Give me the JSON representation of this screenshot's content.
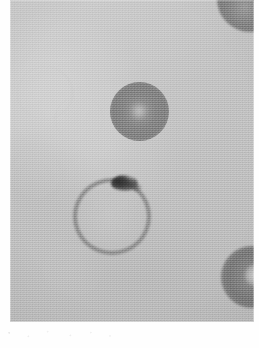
{
  "figure": {
    "domain": "natural-image",
    "media": "grayscale light micrograph",
    "caption": "",
    "title": "",
    "visible_text": "",
    "canvas": {
      "width_px": 259,
      "height_px": 348
    },
    "plate": {
      "left_px": 10,
      "top_px": 0,
      "width_px": 244,
      "height_px": 322,
      "background_color": "#bdbdbd",
      "page_margin_color": "#fefefe"
    },
    "palette": {
      "page_white": "#fefefe",
      "field_light": "#c6c6c6",
      "field_mid": "#bdbdbd",
      "field_deep": "#b5b5b5",
      "cell_body_gray": "#7e7e7e",
      "cell_rim_gray": "#838383",
      "chromatin_black": "#2e2e2e",
      "vacuole_light": "#d6d6d6"
    },
    "objects": [
      {
        "name": "cell-ring-infected",
        "label": "Ring-form trophozoite in erythrocyte",
        "shape": "annulus",
        "center_px": [
          112,
          216
        ],
        "outer_radius_px": 39,
        "rim_thickness_px": 5,
        "rim_tone": "#838383",
        "lumen_tone": "#c2c2c2",
        "cropped": false
      },
      {
        "name": "chromatin-dot",
        "label": "Chromatin dot / pigment mass on ring rim",
        "shape": "irregular-blob",
        "center_px": [
          114,
          183
        ],
        "width_px": 27,
        "height_px": 16,
        "tone": "#2e2e2e",
        "position_on_ring": "upper rim, 12 to 1 o'clock"
      },
      {
        "name": "cell-stained-upper",
        "label": "Densely stained round cell",
        "shape": "disc",
        "center_px": [
          139,
          111
        ],
        "radius_px": 29,
        "tone": "#7c7c7c",
        "center_highlight": true,
        "cropped": false
      },
      {
        "name": "cell-cropped-topright",
        "label": "Stained cell cropped at top-right corner",
        "shape": "disc",
        "center_px": [
          250,
          0
        ],
        "radius_px": 33,
        "tone": "#767676",
        "cropped": true,
        "crop_edges": [
          "top",
          "right"
        ]
      },
      {
        "name": "cell-cropped-right",
        "label": "Stained cell with pale vacuole, cropped at right edge",
        "shape": "disc",
        "center_px": [
          252,
          287
        ],
        "radius_px": 31,
        "tone": "#747474",
        "vacuole_center_px": [
          256,
          285
        ],
        "vacuole_radius_px": 11,
        "cropped": true,
        "crop_edges": [
          "right"
        ]
      },
      {
        "name": "ghost-erythrocytes",
        "label": "Faint out-of-focus ghost cells in plasma field",
        "shape": "discs",
        "count": 5,
        "tone": "#cacaca",
        "cropped": false
      }
    ],
    "texture": {
      "grain": "halftone print screen",
      "vignette": true
    }
  }
}
